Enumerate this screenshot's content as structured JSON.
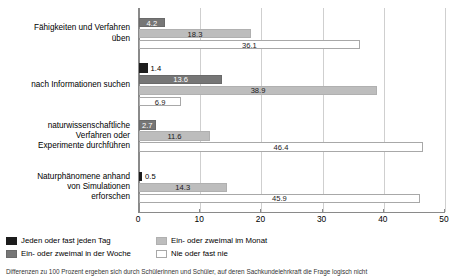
{
  "chart_data": {
    "type": "bar",
    "orientation": "horizontal",
    "title": "",
    "xlabel": "",
    "ylabel": "",
    "xlim": [
      0,
      50
    ],
    "xticks": [
      0,
      10,
      20,
      30,
      40,
      50
    ],
    "grid": true,
    "legend_position": "bottom-left",
    "categories": [
      "Fähigkeiten und Verfahren üben",
      "nach Informationen suchen",
      "naturwissenschaftliche Verfahren oder Experimente durchführen",
      "Naturphänomene anhand von Simulationen erforschen"
    ],
    "category_lines": [
      [
        "Fähigkeiten und Verfahren",
        "üben"
      ],
      [
        "nach Informationen suchen"
      ],
      [
        "naturwissenschaftliche",
        "Verfahren oder",
        "Experimente durchführen"
      ],
      [
        "Naturphänomene anhand",
        "von Simulationen",
        "erforschen"
      ]
    ],
    "series": [
      {
        "name": "Jeden oder fast jeden Tag",
        "color": "#1c1c1c",
        "values": [
          null,
          1.4,
          null,
          0.5
        ]
      },
      {
        "name": "Ein- oder zweimal in der Woche",
        "color": "#767676",
        "values": [
          4.2,
          13.6,
          2.7,
          null
        ]
      },
      {
        "name": "Ein- oder zweimal im Monat",
        "color": "#bdbdbd",
        "values": [
          18.3,
          38.9,
          11.6,
          14.3
        ]
      },
      {
        "name": "Nie oder fast nie",
        "color": "#ffffff",
        "values": [
          36.1,
          6.9,
          46.4,
          45.9
        ]
      }
    ],
    "groups": [
      {
        "label": "Fähigkeiten und Verfahren üben",
        "bars": [
          {
            "series": "Ein- oder zweimal in der Woche",
            "value": 4.2,
            "style": "s1",
            "label": "4.2",
            "placement": "inside"
          },
          {
            "series": "Ein- oder zweimal im Monat",
            "value": 18.3,
            "style": "s2",
            "label": "18.3",
            "placement": "inside-dark"
          },
          {
            "series": "Nie oder fast nie",
            "value": 36.1,
            "style": "s3",
            "label": "36.1",
            "placement": "inside-dark"
          }
        ]
      },
      {
        "label": "nach Informationen suchen",
        "bars": [
          {
            "series": "Jeden oder fast jeden Tag",
            "value": 1.4,
            "style": "s0",
            "label": "1.4",
            "placement": "outside"
          },
          {
            "series": "Ein- oder zweimal in der Woche",
            "value": 13.6,
            "style": "s1",
            "label": "13.6",
            "placement": "inside"
          },
          {
            "series": "Ein- oder zweimal im Monat",
            "value": 38.9,
            "style": "s2",
            "label": "38.9",
            "placement": "inside-dark"
          },
          {
            "series": "Nie oder fast nie",
            "value": 6.9,
            "style": "s3",
            "label": "6.9",
            "placement": "inside-dark"
          }
        ]
      },
      {
        "label": "naturwissenschaftliche Verfahren oder Experimente durchführen",
        "bars": [
          {
            "series": "Ein- oder zweimal in der Woche",
            "value": 2.7,
            "style": "s1",
            "label": "2.7",
            "placement": "inside"
          },
          {
            "series": "Ein- oder zweimal im Monat",
            "value": 11.6,
            "style": "s2",
            "label": "11.6",
            "placement": "inside-dark"
          },
          {
            "series": "Nie oder fast nie",
            "value": 46.4,
            "style": "s3",
            "label": "46.4",
            "placement": "inside-dark"
          }
        ]
      },
      {
        "label": "Naturphänomene anhand von Simulationen erforschen",
        "bars": [
          {
            "series": "Jeden oder fast jeden Tag",
            "value": 0.5,
            "style": "s0",
            "label": "0.5",
            "placement": "outside"
          },
          {
            "series": "Ein- oder zweimal im Monat",
            "value": 14.3,
            "style": "s2",
            "label": "14.3",
            "placement": "inside-dark"
          },
          {
            "series": "Nie oder fast nie",
            "value": 45.9,
            "style": "s3",
            "label": "45.9",
            "placement": "inside-dark"
          }
        ]
      }
    ]
  },
  "legend": {
    "items": [
      {
        "label": "Jeden oder fast jeden Tag",
        "style": "s0"
      },
      {
        "label": "Ein- oder zweimal im Monat",
        "style": "s2"
      },
      {
        "label": "Ein- oder zweimal in der Woche",
        "style": "s1"
      },
      {
        "label": "Nie oder fast nie",
        "style": "s3"
      }
    ]
  },
  "footnote": {
    "text": "Differenzen zu 100 Prozent ergeben sich durch Schülerinnen und Schüler, auf deren Sachkundelehrkraft die Frage logisch nicht"
  }
}
